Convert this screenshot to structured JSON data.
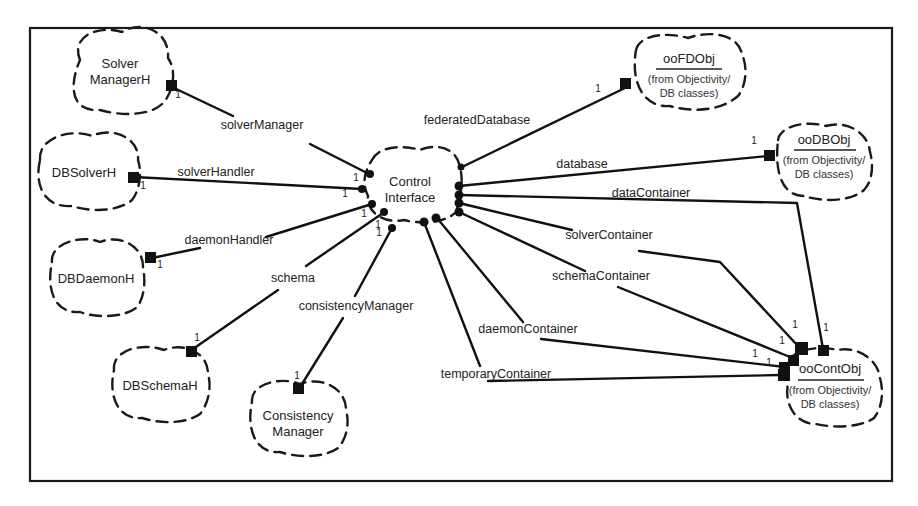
{
  "diagram": {
    "type": "uml-class-diagram-booch",
    "classes": [
      {
        "id": "solverManagerH",
        "lines": [
          "Solver",
          "ManagerH"
        ],
        "cx": 122,
        "cy": 74,
        "rx": 50,
        "ry": 38
      },
      {
        "id": "dbSolverH",
        "lines": [
          "DBSolverH"
        ],
        "cx": 84,
        "cy": 172,
        "rx": 50,
        "ry": 37
      },
      {
        "id": "dbDaemonH",
        "lines": [
          "DBDaemonH"
        ],
        "cx": 96,
        "cy": 278,
        "rx": 48,
        "ry": 37
      },
      {
        "id": "dbSchemaH",
        "lines": [
          "DBSchemaH"
        ],
        "cx": 160,
        "cy": 385,
        "rx": 50,
        "ry": 37
      },
      {
        "id": "consistencyManager",
        "lines": [
          "Consistency",
          "Manager"
        ],
        "cx": 298,
        "cy": 418,
        "rx": 50,
        "ry": 37
      },
      {
        "id": "controlInterface",
        "lines": [
          "Control",
          "Interface"
        ],
        "cx": 408,
        "cy": 188,
        "rx": 46,
        "ry": 36
      },
      {
        "id": "ooFDObj",
        "lines": [
          "ooFDObj"
        ],
        "sub": [
          "(from Objectivity/",
          "DB classes)"
        ],
        "underline": true,
        "cx": 690,
        "cy": 70,
        "rx": 58,
        "ry": 40
      },
      {
        "id": "ooDBObj",
        "lines": [
          "ooDBObj"
        ],
        "sub": [
          "(from Objectivity/",
          "DB classes)"
        ],
        "underline": true,
        "cx": 818,
        "cy": 160,
        "rx": 54,
        "ry": 38
      },
      {
        "id": "ooContObj",
        "lines": [
          "ooContObj"
        ],
        "sub": [
          "(from Objectivity/",
          "DB classes)"
        ],
        "underline": true,
        "cx": 832,
        "cy": 384,
        "rx": 52,
        "ry": 42
      }
    ],
    "relations": [
      {
        "label": "solverManager",
        "from": "controlInterface",
        "to": "solverManagerH",
        "multiplicity": "1",
        "label_x": 262,
        "label_y": 129
      },
      {
        "label": "solverHandler",
        "from": "controlInterface",
        "to": "dbSolverH",
        "multiplicity": "1",
        "label_x": 216,
        "label_y": 176
      },
      {
        "label": "daemonHandler",
        "from": "controlInterface",
        "to": "dbDaemonH",
        "multiplicity": "1",
        "label_x": 229,
        "label_y": 244
      },
      {
        "label": "schema",
        "from": "controlInterface",
        "to": "dbSchemaH",
        "multiplicity": "1",
        "label_x": 293,
        "label_y": 282
      },
      {
        "label": "consistencyManager",
        "from": "controlInterface",
        "to": "consistencyManager",
        "multiplicity": "1",
        "label_x": 356,
        "label_y": 310
      },
      {
        "label": "federatedDatabase",
        "from": "controlInterface",
        "to": "ooFDObj",
        "multiplicity": "1",
        "label_x": 477,
        "label_y": 124
      },
      {
        "label": "database",
        "from": "controlInterface",
        "to": "ooDBObj",
        "multiplicity": "1",
        "label_x": 582,
        "label_y": 168
      },
      {
        "label": "dataContainer",
        "from": "controlInterface",
        "to": "ooContObj",
        "multiplicity": "1",
        "label_x": 651,
        "label_y": 197
      },
      {
        "label": "solverContainer",
        "from": "controlInterface",
        "to": "ooContObj",
        "multiplicity": "1",
        "label_x": 609,
        "label_y": 239
      },
      {
        "label": "schemaContainer",
        "from": "controlInterface",
        "to": "ooContObj",
        "multiplicity": "1",
        "label_x": 601,
        "label_y": 280
      },
      {
        "label": "daemonContainer",
        "from": "controlInterface",
        "to": "ooContObj",
        "multiplicity": "1",
        "label_x": 528,
        "label_y": 333
      },
      {
        "label": "temporaryContainer",
        "from": "controlInterface",
        "to": "ooContObj",
        "multiplicity": "1",
        "label_x": 496,
        "label_y": 378
      }
    ]
  },
  "classes": {
    "solverManagerH": {
      "l1": "Solver",
      "l2": "ManagerH"
    },
    "dbSolverH": {
      "l1": "DBSolverH"
    },
    "dbDaemonH": {
      "l1": "DBDaemonH"
    },
    "dbSchemaH": {
      "l1": "DBSchemaH"
    },
    "consistencyManager": {
      "l1": "Consistency",
      "l2": "Manager"
    },
    "controlInterface": {
      "l1": "Control",
      "l2": "Interface"
    },
    "ooFDObj": {
      "l1": "ooFDObj",
      "s1": "(from Objectivity/",
      "s2": "DB classes)"
    },
    "ooDBObj": {
      "l1": "ooDBObj",
      "s1": "(from Objectivity/",
      "s2": "DB classes)"
    },
    "ooContObj": {
      "l1": "ooContObj",
      "s1": "(from Objectivity/",
      "s2": "DB classes)"
    }
  },
  "labels": {
    "solverManager": "solverManager",
    "solverHandler": "solverHandler",
    "daemonHandler": "daemonHandler",
    "schema": "schema",
    "consistencyManager": "consistencyManager",
    "federatedDatabase": "federatedDatabase",
    "database": "database",
    "dataContainer": "dataContainer",
    "solverContainer": "solverContainer",
    "schemaContainer": "schemaContainer",
    "daemonContainer": "daemonContainer",
    "temporaryContainer": "temporaryContainer"
  },
  "multiplicity": "1"
}
